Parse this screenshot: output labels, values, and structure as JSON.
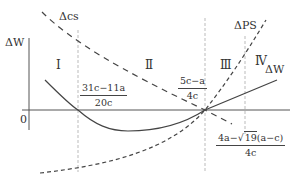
{
  "diagram": {
    "axes": {
      "y_label": "ΔW",
      "origin_label": "0"
    },
    "curves": {
      "delta_cs": {
        "label": "Δcs",
        "style": "dashed"
      },
      "delta_ps": {
        "label": "ΔPS",
        "style": "dashed"
      },
      "delta_w": {
        "label": "ΔW",
        "style": "solid"
      }
    },
    "regions": [
      "Ⅰ",
      "Ⅱ",
      "Ⅲ",
      "Ⅳ"
    ],
    "markers": [
      {
        "numerator": "31c−11a",
        "denominator": "20c"
      },
      {
        "numerator": "5c−a",
        "denominator": "4c"
      },
      {
        "numerator_prefix": "4a−",
        "numerator_sqrt": "19",
        "numerator_suffix_open": "(",
        "numerator_suffix_inner": "a−c",
        "numerator_suffix_close": ")",
        "denominator": "4c"
      }
    ],
    "colors": {
      "line": "#444444",
      "dashed_guides": "#bbbbbb",
      "background": "#ffffff"
    }
  }
}
